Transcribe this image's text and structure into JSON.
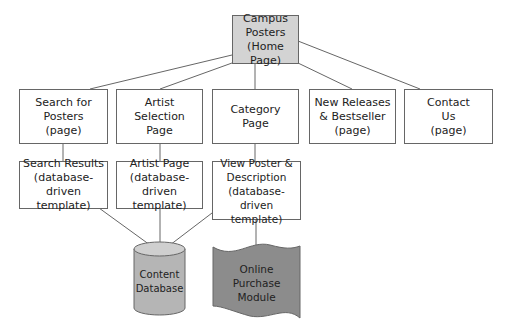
{
  "diagram": {
    "colors": {
      "home_fill": "#d3d3d3",
      "database_fill": "#b5b5b5",
      "module_fill": "#8c8c8c",
      "line": "#666666"
    },
    "home": {
      "label": "Campus\nPosters\n(Home Page)"
    },
    "level1": [
      {
        "label": "Search for\nPosters\n(page)"
      },
      {
        "label": "Artist\nSelection\nPage"
      },
      {
        "label": "Category\nPage"
      },
      {
        "label": "New Releases\n& Bestseller\n(page)"
      },
      {
        "label": "Contact\nUs\n(page)"
      }
    ],
    "level2": [
      {
        "label": "Search Results\n(database-driven\ntemplate)"
      },
      {
        "label": "Artist Page\n(database-driven\ntemplate)"
      },
      {
        "label": "View Poster &\nDescription\n(database-driven\ntemplate)"
      }
    ],
    "database": {
      "label": "Content\nDatabase",
      "icon": "database-cylinder"
    },
    "module": {
      "label": "Online\nPurchase\nModule",
      "icon": "document-wave"
    }
  }
}
